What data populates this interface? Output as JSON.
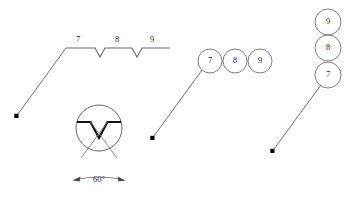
{
  "figure": {
    "title": "",
    "background_color": "#ffffff",
    "line_color": "#5d5d5d",
    "bold_line_color": "#111111",
    "text_color": "#2b2b2b"
  },
  "notched_line_view": {
    "name": "notched-edge-view",
    "labels": [
      {
        "text": "7",
        "x": 78,
        "y": 44
      },
      {
        "text": "8",
        "x": 117,
        "y": 44
      },
      {
        "text": "9",
        "x": 152,
        "y": 44
      }
    ],
    "leader_dot": {
      "x": 16,
      "y": 116
    }
  },
  "detail_circle_view": {
    "name": "detail-circle-view",
    "angle_label": "60°",
    "angle_value": 60,
    "center": {
      "x": 99,
      "y": 128
    },
    "radius": 23
  },
  "horizontal_balloons": {
    "name": "horizontal-balloon-row",
    "items": [
      {
        "text": "7",
        "cx": 210,
        "cy": 61
      },
      {
        "text": "8",
        "cx": 235,
        "cy": 61
      },
      {
        "text": "9",
        "cx": 260,
        "cy": 61
      }
    ],
    "radius": 12,
    "leader_dot": {
      "x": 152,
      "y": 138
    }
  },
  "vertical_balloons": {
    "name": "vertical-balloon-stack",
    "items": [
      {
        "text": "9",
        "cx": 328,
        "cy": 22
      },
      {
        "text": "8",
        "cx": 328,
        "cy": 48
      },
      {
        "text": "7",
        "cx": 328,
        "cy": 75
      }
    ],
    "radius": 13,
    "leader_dot": {
      "x": 272,
      "y": 151
    }
  }
}
